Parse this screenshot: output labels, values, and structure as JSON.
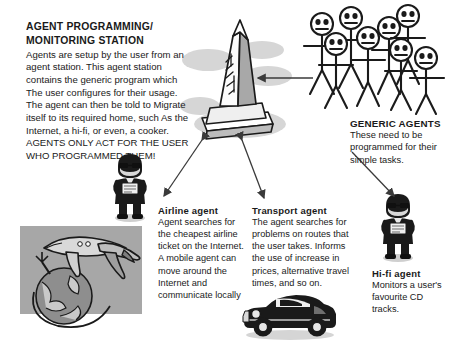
{
  "station": {
    "title_line1": "AGENT PROGRAMMING/",
    "title_line2": "MONITORING STATION",
    "body": "Agents are setup by the user from an agent station. This agent station contains the generic program which The user configures for their usage. The agent can then be told to Migrate itself to its required home, such As the Internet, a hi-fi, or even, a cooker. AGENTS ONLY ACT FOR THE USER WHO PROGRAMMED THEM!"
  },
  "generic_agents": {
    "title": "GENERIC AGENTS",
    "body": "These need to be programmed for their simple tasks."
  },
  "airline_agent": {
    "title": "Airline agent",
    "body": "Agent searches for the cheapest airline ticket on the Internet. A mobile agent can move around the Internet and communicate locally"
  },
  "transport_agent": {
    "title": "Transport agent",
    "body": "The agent searches for problems on routes that the user takes. Informs the use of increase in prices, alternative travel times, and so on."
  },
  "hifi_agent": {
    "title": "Hi-fi agent",
    "body": "Monitors a user's favourite CD tracks."
  },
  "artwork": {
    "monument": "agent-station-monument",
    "crowd": "generic-agents-crowd",
    "airplane_globe": "airplane-over-globe",
    "classic_car": "classic-car",
    "agent_man_left": "agent-man-figure",
    "agent_man_right": "agent-man-figure"
  },
  "connectors": {
    "station_to_crowd": "arrow-left",
    "station_to_airline": "double-arrow",
    "station_to_transport": "double-arrow",
    "crowd_to_hifi": "arrow-down-left"
  },
  "colors": {
    "ink": "#1a1a1a",
    "line": "#3a3a3a",
    "shadow": "#c9c9c9",
    "panel": "#a9a9a9",
    "mid_gray": "#8c8c8c",
    "light_gray": "#d8d8d8"
  }
}
